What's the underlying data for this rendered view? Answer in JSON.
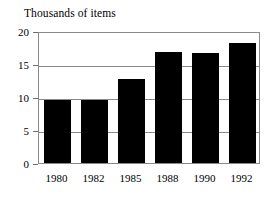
{
  "chart_data": {
    "type": "bar",
    "title": "Thousands of items",
    "xlabel": "",
    "ylabel": "Thousands of items",
    "categories": [
      "1980",
      "1982",
      "1985",
      "1988",
      "1990",
      "1992"
    ],
    "values": [
      9.5,
      9.5,
      12.8,
      16.8,
      16.6,
      18.2
    ],
    "ylim": [
      0,
      20
    ],
    "yticks": [
      0,
      5,
      10,
      15,
      20
    ],
    "ytick_labels": [
      "0",
      "5",
      "10",
      "15",
      "20"
    ],
    "grid": "horizontal",
    "legend": "none",
    "bar_color": "#000000",
    "grid_color": "#8a8a8a",
    "background_color": "#ffffff"
  },
  "axes": {
    "y_ticks": [
      {
        "label": "20",
        "value": 20
      },
      {
        "label": "15",
        "value": 15
      },
      {
        "label": "10",
        "value": 10
      },
      {
        "label": "5",
        "value": 5
      },
      {
        "label": "0",
        "value": 0
      }
    ],
    "x_ticks": [
      {
        "label": "1980"
      },
      {
        "label": "1982"
      },
      {
        "label": "1985"
      },
      {
        "label": "1988"
      },
      {
        "label": "1990"
      },
      {
        "label": "1992"
      }
    ]
  },
  "bars": [
    {
      "category": "1980",
      "value": 9.5
    },
    {
      "category": "1982",
      "value": 9.5
    },
    {
      "category": "1985",
      "value": 12.8
    },
    {
      "category": "1988",
      "value": 16.8
    },
    {
      "category": "1990",
      "value": 16.6
    },
    {
      "category": "1992",
      "value": 18.2
    }
  ]
}
